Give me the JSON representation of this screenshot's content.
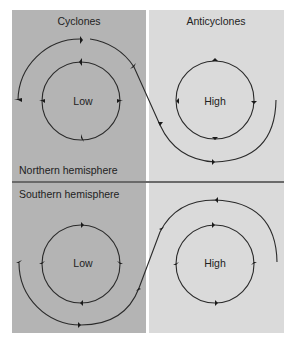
{
  "columns": {
    "left": {
      "title": "Cyclones",
      "color": "#b4b4b4"
    },
    "right": {
      "title": "Anticyclones",
      "color": "#dadada"
    }
  },
  "rows": {
    "top": {
      "label": "Northern hemisphere"
    },
    "bottom": {
      "label": "Southern hemisphere"
    }
  },
  "centers": {
    "nh_low": "Low",
    "nh_high": "High",
    "sh_low": "Low",
    "sh_high": "High"
  },
  "colors": {
    "line": "#2a2a2a",
    "divider": "#6a6a6a",
    "text": "#222222"
  }
}
